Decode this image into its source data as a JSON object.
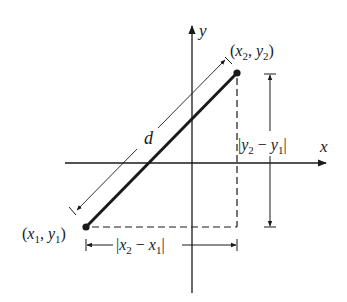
{
  "diagram": {
    "axes": {
      "x_label": "x",
      "y_label": "y"
    },
    "points": [
      {
        "name": "P1",
        "label_open": "(",
        "var_a": "x",
        "sub_a": "1",
        "sep": ", ",
        "var_b": "y",
        "sub_b": "1",
        "label_close": ")"
      },
      {
        "name": "P2",
        "label_open": "(",
        "var_a": "x",
        "sub_a": "2",
        "sep": ", ",
        "var_b": "y",
        "sub_b": "2",
        "label_close": ")"
      }
    ],
    "segment_label": "d",
    "horizontal_dimension": {
      "bar_left": "|",
      "var_a": "x",
      "sub_a": "2",
      "minus": " − ",
      "var_b": "x",
      "sub_b": "1",
      "bar_right": "|"
    },
    "vertical_dimension": {
      "bar_left": "|",
      "var_a": "y",
      "sub_a": "2",
      "minus": " − ",
      "var_b": "y",
      "sub_b": "1",
      "bar_right": "|"
    },
    "colors": {
      "ink": "#1a1a1a",
      "background": "#ffffff"
    }
  }
}
